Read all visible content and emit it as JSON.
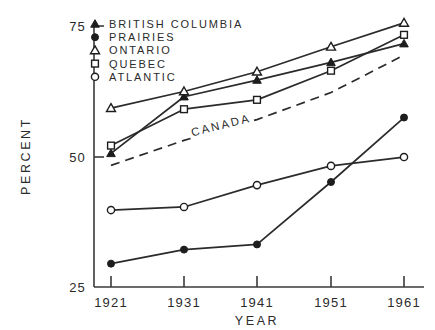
{
  "chart_data": {
    "type": "line",
    "title": "",
    "xlabel": "YEAR",
    "ylabel": "PERCENT",
    "x": [
      1921,
      1931,
      1941,
      1951,
      1961
    ],
    "xtick_labels": [
      "1921",
      "1931",
      "1941",
      "1951",
      "1961"
    ],
    "ytick_labels": [
      "25",
      "50",
      "75"
    ],
    "yticks": [
      25,
      50,
      75
    ],
    "xlim": [
      1916,
      1966
    ],
    "ylim": [
      25,
      75
    ],
    "grid": false,
    "legend_position": "top-left",
    "series": [
      {
        "name": "BRITISH COLUMBIA",
        "marker": "filled-triangle",
        "linestyle": "solid",
        "values": [
          50.5,
          61.4,
          64.6,
          68.0,
          71.6
        ]
      },
      {
        "name": "PRAIRIES",
        "marker": "filled-circle",
        "linestyle": "solid",
        "values": [
          29.3,
          32.0,
          33.0,
          45.0,
          57.4
        ]
      },
      {
        "name": "ONTARIO",
        "marker": "open-triangle",
        "linestyle": "solid",
        "values": [
          59.2,
          62.4,
          66.2,
          71.0,
          75.6
        ]
      },
      {
        "name": "QUEBEC",
        "marker": "open-square",
        "linestyle": "solid",
        "values": [
          52.0,
          59.0,
          60.8,
          66.4,
          73.3
        ]
      },
      {
        "name": "ATLANTIC",
        "marker": "open-circle",
        "linestyle": "solid",
        "values": [
          39.6,
          40.2,
          44.4,
          48.1,
          49.8
        ]
      }
    ],
    "annotated_series": {
      "name": "CANADA",
      "label": "CANADA",
      "marker": "none",
      "linestyle": "dashed",
      "values": [
        48.2,
        53.0,
        57.0,
        62.2,
        69.4
      ]
    }
  },
  "legend": {
    "items": [
      {
        "label": "BRITISH COLUMBIA",
        "marker": "filled-triangle"
      },
      {
        "label": "PRAIRIES",
        "marker": "filled-circle"
      },
      {
        "label": "ONTARIO",
        "marker": "open-triangle"
      },
      {
        "label": "QUEBEC",
        "marker": "open-square"
      },
      {
        "label": "ATLANTIC",
        "marker": "open-circle"
      }
    ]
  },
  "axes": {
    "y_title": "PERCENT",
    "x_title": "YEAR"
  }
}
